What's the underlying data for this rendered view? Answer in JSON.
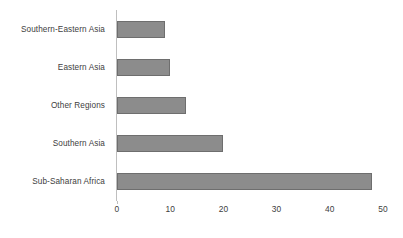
{
  "chart_data": {
    "type": "bar",
    "orientation": "horizontal",
    "title": "",
    "subtitle": "",
    "xlabel": "",
    "ylabel": "",
    "categories": [
      "Southern-Eastern Asia",
      "Eastern Asia",
      "Other Regions",
      "Southern Asia",
      "Sub-Saharan Africa"
    ],
    "values": [
      9,
      10,
      13,
      20,
      48
    ],
    "xlim": [
      0,
      50
    ],
    "xticks": [
      0,
      10,
      20,
      30,
      40,
      50
    ],
    "xtick_labels": [
      "0",
      "10",
      "20",
      "30",
      "40",
      "50"
    ],
    "grid": false,
    "legend": null,
    "legend_position": "none",
    "annotations": [],
    "colors": {
      "bar_fill": "#8c8c8c",
      "bar_border": "#6e6e6e",
      "axis_line": "#bfbfbf",
      "text": "#404040",
      "background": "#ffffff"
    }
  }
}
